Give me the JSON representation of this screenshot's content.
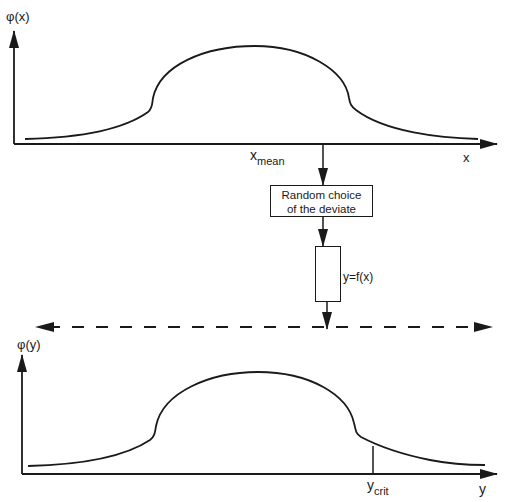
{
  "top_plot": {
    "y_axis_label": "φ(x)",
    "x_axis_label": "x",
    "mean_label_main": "x",
    "mean_label_sub": "mean"
  },
  "process": {
    "random_choice_box": {
      "line1": "Random choice",
      "line2": "of the deviate"
    },
    "transform_label": "y=f(x)"
  },
  "bottom_plot": {
    "y_axis_label": "φ(y)",
    "x_axis_label": "y",
    "crit_label_main": "y",
    "crit_label_sub": "crit"
  },
  "colors": {
    "stroke": "#1a1a1a",
    "background": "#ffffff"
  }
}
